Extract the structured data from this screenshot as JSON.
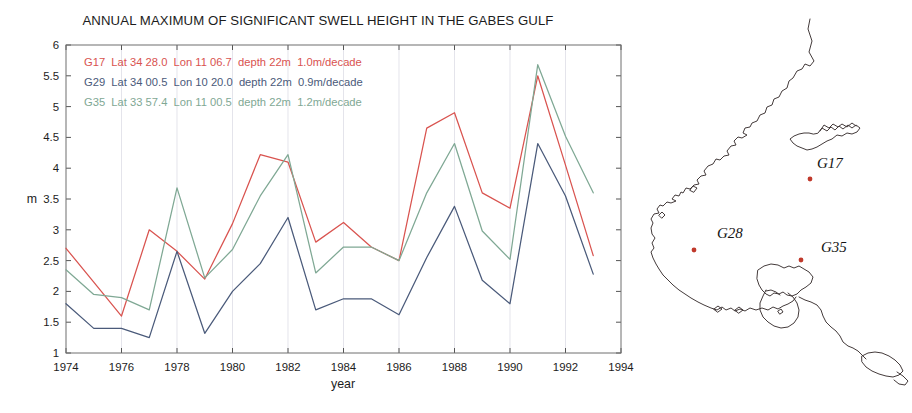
{
  "chart_data": {
    "type": "line",
    "title": "ANNUAL MAXIMUM OF SIGNIFICANT SWELL HEIGHT IN THE GABES GULF",
    "xlabel": "year",
    "ylabel": "m",
    "xlim": [
      1974,
      1994
    ],
    "ylim": [
      1,
      6
    ],
    "xticks": [
      1974,
      1976,
      1978,
      1980,
      1982,
      1984,
      1986,
      1988,
      1990,
      1992,
      1994
    ],
    "yticks": [
      1,
      1.5,
      2,
      2.5,
      3,
      3.5,
      4,
      4.5,
      5,
      5.5,
      6
    ],
    "xtick_labels": [
      "1974",
      "1976",
      "1978",
      "1980",
      "1982",
      "1984",
      "1986",
      "1988",
      "1990",
      "1992",
      "1994"
    ],
    "ytick_labels": [
      "1",
      "1.5",
      "2",
      "2.5",
      "3",
      "3.5",
      "4",
      "4.5",
      "5",
      "5.5",
      "6"
    ],
    "grid": "vertical",
    "legend_position": "upper-left",
    "x": [
      1974,
      1975,
      1976,
      1977,
      1978,
      1979,
      1980,
      1981,
      1982,
      1983,
      1984,
      1985,
      1986,
      1987,
      1988,
      1989,
      1990,
      1991,
      1992,
      1993
    ],
    "series": [
      {
        "name": "G17",
        "color": "#d9534f",
        "label": "G17  Lat 34 28.0  Lon 11 06.7  depth 22m  1.0m/decade",
        "lat": "34 28.0",
        "lon": "11 06.7",
        "depth": "22m",
        "trend": "1.0m/decade",
        "values": [
          2.7,
          2.15,
          1.6,
          3.0,
          2.65,
          2.2,
          3.1,
          4.22,
          4.1,
          2.8,
          3.12,
          2.72,
          2.5,
          4.65,
          4.9,
          3.6,
          3.35,
          5.5,
          4.05,
          2.58
        ]
      },
      {
        "name": "G29",
        "color": "#4a5a7a",
        "label": "G29  Lat 34 00.5  Lon 10 20.0  depth 22m  0.9m/decade",
        "lat": "34 00.5",
        "lon": "10 20.0",
        "depth": "22m",
        "trend": "0.9m/decade",
        "values": [
          1.8,
          1.4,
          1.4,
          1.25,
          2.65,
          1.32,
          2.0,
          2.45,
          3.2,
          1.7,
          1.88,
          1.88,
          1.62,
          2.55,
          3.38,
          2.18,
          1.8,
          4.4,
          3.55,
          2.28
        ]
      },
      {
        "name": "G35",
        "color": "#7fa894",
        "label": "G35  Lat 33 57.4  Lon 11 00.5  depth 22m  1.2m/decade",
        "lat": "33 57.4",
        "lon": "11 00.5",
        "depth": "22m",
        "trend": "1.2m/decade",
        "values": [
          2.35,
          1.95,
          1.9,
          1.7,
          3.68,
          2.22,
          2.68,
          3.55,
          4.22,
          2.3,
          2.72,
          2.72,
          2.5,
          3.6,
          4.4,
          2.98,
          2.52,
          5.68,
          4.52,
          3.6
        ]
      }
    ]
  },
  "map": {
    "sites": [
      {
        "label": "G17",
        "x": 817,
        "y": 168,
        "dot_x": 810,
        "dot_y": 179
      },
      {
        "label": "G28",
        "x": 717,
        "y": 238,
        "dot_x": 694,
        "dot_y": 250
      },
      {
        "label": "G35",
        "x": 821,
        "y": 252,
        "dot_x": 801,
        "dot_y": 260
      }
    ],
    "dot_color": "#c0392b",
    "coast_color": "#3a3030"
  }
}
